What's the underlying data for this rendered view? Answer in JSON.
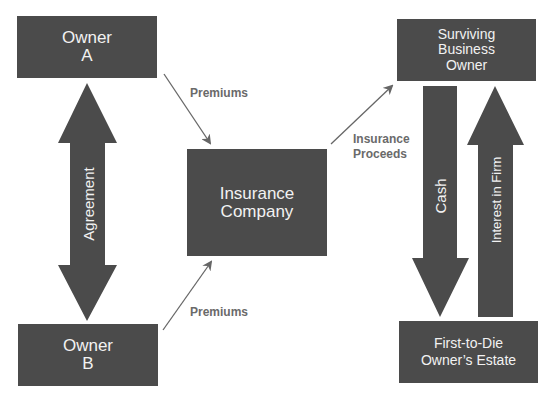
{
  "diagram": {
    "colors": {
      "box_fill": "#4b4b4b",
      "box_text": "#f2f2f2",
      "arrow": "#666666",
      "label": "#6a6a6a",
      "background": "#ffffff"
    },
    "nodes": {
      "owner_a": {
        "line1": "Owner",
        "line2": "A"
      },
      "owner_b": {
        "line1": "Owner",
        "line2": "B"
      },
      "insurance_company": {
        "line1": "Insurance",
        "line2": "Company"
      },
      "surviving_owner": {
        "line1": "Surviving",
        "line2": "Business",
        "line3": "Owner"
      },
      "estate": {
        "line1": "First-to-Die",
        "line2": "Owner’s Estate"
      }
    },
    "edges": {
      "agreement": {
        "label": "Agreement",
        "from": "Owner A",
        "to": "Owner B",
        "type": "double-block-arrow"
      },
      "premiums_a": {
        "label": "Premiums",
        "from": "Owner A",
        "to": "Insurance Company"
      },
      "premiums_b": {
        "label": "Premiums",
        "from": "Owner B",
        "to": "Insurance Company"
      },
      "proceeds": {
        "line1": "Insurance",
        "line2": "Proceeds",
        "from": "Insurance Company",
        "to": "Surviving Business Owner"
      },
      "cash": {
        "label": "Cash",
        "from": "Surviving Business Owner",
        "to": "First-to-Die Owner's Estate",
        "type": "block-arrow"
      },
      "interest": {
        "label": "Interest in Firm",
        "from": "First-to-Die Owner's Estate",
        "to": "Surviving Business Owner",
        "type": "block-arrow"
      }
    }
  }
}
